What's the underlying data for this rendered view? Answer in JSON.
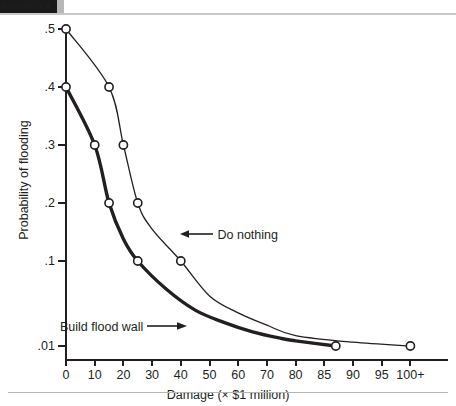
{
  "header": {
    "block_label": "FIGURE 7.4",
    "accent_color": "#1a1a1a",
    "tail_color": "#b8b8b8"
  },
  "chart_data": {
    "type": "line",
    "title": "",
    "subtitle": "",
    "xlabel": "Damage (× $1 million)",
    "ylabel": "Probability of flooding",
    "grid": false,
    "legend_position": "inline-annotations",
    "x_ticks": [
      "0",
      "10",
      "20",
      "30",
      "40",
      "50",
      "60",
      "70",
      "80",
      "85",
      "90",
      "95",
      "100+"
    ],
    "x_tick_values": [
      0,
      10,
      20,
      30,
      40,
      50,
      60,
      70,
      80,
      85,
      90,
      95,
      100
    ],
    "y_ticks": [
      ".5",
      ".4",
      ".3",
      ".2",
      ".1",
      ".01"
    ],
    "y_tick_values": [
      0.5,
      0.4,
      0.3,
      0.2,
      0.1,
      0.01
    ],
    "xlim": [
      0,
      100
    ],
    "ylim": [
      0.01,
      0.5
    ],
    "x_axis_scale": "piecewise-linear (0-80 at 10-unit steps, 80-100 at 5-unit steps)",
    "y_axis_scale": "piecewise-linear (0.5-0.1 evenly, then compressed to 0.01)",
    "series": [
      {
        "name": "Do nothing",
        "line_width": "thin",
        "color": "#231f20",
        "marker": "open-circle",
        "points": [
          {
            "x": 0,
            "y": 0.5
          },
          {
            "x": 15,
            "y": 0.4
          },
          {
            "x": 20,
            "y": 0.3
          },
          {
            "x": 25,
            "y": 0.2
          },
          {
            "x": 40,
            "y": 0.1
          },
          {
            "x": 100,
            "y": 0.01
          }
        ]
      },
      {
        "name": "Build flood wall",
        "line_width": "thick",
        "color": "#231f20",
        "marker": "open-circle",
        "points": [
          {
            "x": 0,
            "y": 0.4
          },
          {
            "x": 10,
            "y": 0.3
          },
          {
            "x": 15,
            "y": 0.2
          },
          {
            "x": 25,
            "y": 0.1
          },
          {
            "x": 87,
            "y": 0.01
          }
        ]
      }
    ],
    "annotations": [
      {
        "id": "do-nothing",
        "text": "Do nothing",
        "arrow": "left"
      },
      {
        "id": "build-flood-wall",
        "text": "Build flood wall",
        "arrow": "right"
      }
    ]
  }
}
